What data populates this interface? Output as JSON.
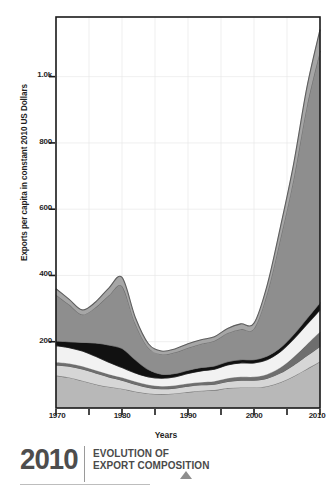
{
  "chart_data": {
    "type": "area",
    "title": "",
    "xlabel": "Years",
    "ylabel": "Exports per capita in constant 2010 US Dollars",
    "xlim": [
      1970,
      2010
    ],
    "ylim": [
      0,
      1180
    ],
    "grid": true,
    "legend_position": "none",
    "stacked": true,
    "x": [
      1970,
      1972,
      1974,
      1976,
      1978,
      1980,
      1982,
      1984,
      1986,
      1988,
      1990,
      1992,
      1994,
      1996,
      1998,
      2000,
      2002,
      2004,
      2006,
      2008,
      2010
    ],
    "y_ticks": [
      {
        "value": 200,
        "label": "200"
      },
      {
        "value": 400,
        "label": "400"
      },
      {
        "value": 600,
        "label": "600"
      },
      {
        "value": 800,
        "label": "800"
      },
      {
        "value": 1000,
        "label": "1.0k"
      }
    ],
    "x_ticks": [
      {
        "value": 1970,
        "label": "1970",
        "major": true
      },
      {
        "value": 1975,
        "label": "",
        "major": false
      },
      {
        "value": 1980,
        "label": "1980",
        "major": true
      },
      {
        "value": 1985,
        "label": "",
        "major": false
      },
      {
        "value": 1990,
        "label": "1990",
        "major": true
      },
      {
        "value": 1995,
        "label": "",
        "major": false
      },
      {
        "value": 2000,
        "label": "2000",
        "major": true
      },
      {
        "value": 2005,
        "label": "",
        "major": false
      },
      {
        "value": 2010,
        "label": "2010",
        "major": true
      }
    ],
    "series": [
      {
        "name": "band-1-light-grey",
        "color": "#b8b8b8",
        "values": [
          98,
          92,
          82,
          72,
          64,
          58,
          50,
          44,
          42,
          44,
          48,
          52,
          54,
          60,
          62,
          62,
          66,
          78,
          96,
          118,
          140
        ]
      },
      {
        "name": "band-2-pale-grey",
        "color": "#d6d6d6",
        "values": [
          32,
          34,
          36,
          34,
          30,
          26,
          22,
          18,
          16,
          16,
          18,
          18,
          18,
          20,
          22,
          22,
          24,
          28,
          34,
          40,
          46
        ]
      },
      {
        "name": "band-3-outline-dark",
        "color": "#6e6e6e",
        "values": [
          8,
          8,
          8,
          8,
          8,
          8,
          8,
          8,
          8,
          8,
          8,
          8,
          9,
          10,
          10,
          10,
          12,
          16,
          24,
          34,
          44
        ]
      },
      {
        "name": "band-4-white",
        "color": "#f2f2f2",
        "values": [
          50,
          48,
          46,
          42,
          36,
          30,
          26,
          24,
          24,
          26,
          30,
          34,
          36,
          40,
          42,
          42,
          44,
          48,
          54,
          60,
          66
        ]
      },
      {
        "name": "band-5-black",
        "color": "#111111",
        "values": [
          14,
          18,
          26,
          40,
          52,
          58,
          40,
          22,
          12,
          10,
          10,
          10,
          10,
          10,
          10,
          10,
          11,
          12,
          14,
          18,
          22
        ]
      },
      {
        "name": "band-6-mid-grey",
        "color": "#8e8e8e",
        "values": [
          140,
          112,
          84,
          108,
          150,
          188,
          110,
          66,
          60,
          64,
          68,
          72,
          76,
          86,
          92,
          94,
          190,
          330,
          470,
          640,
          760
        ]
      },
      {
        "name": "band-7-top-grey",
        "color": "#a6a6a6",
        "values": [
          18,
          16,
          14,
          16,
          22,
          26,
          18,
          12,
          10,
          10,
          12,
          12,
          12,
          14,
          16,
          16,
          24,
          34,
          44,
          56,
          64
        ]
      }
    ],
    "stack_totals_note": "Total exports per capita rises from ~360 in 1970 to ~1140 in 2010, with a local peak of ~415 around 1980 and a trough of ~185 around 1985."
  },
  "axis": {
    "ylabel": "Exports per capita in constant 2010 US Dollars",
    "xlabel": "Years"
  },
  "footer": {
    "year": "2010",
    "title_line1": "EVOLUTION OF",
    "title_line2": "EXPORT COMPOSITION",
    "marker": "triangle-up-icon"
  },
  "colors": {
    "axis": "#1a1a1a",
    "grid": "#e8e8e8",
    "plot_background": "#ffffff",
    "footer_text": "#4a4a4a",
    "footer_marker": "#8e8e8e"
  }
}
